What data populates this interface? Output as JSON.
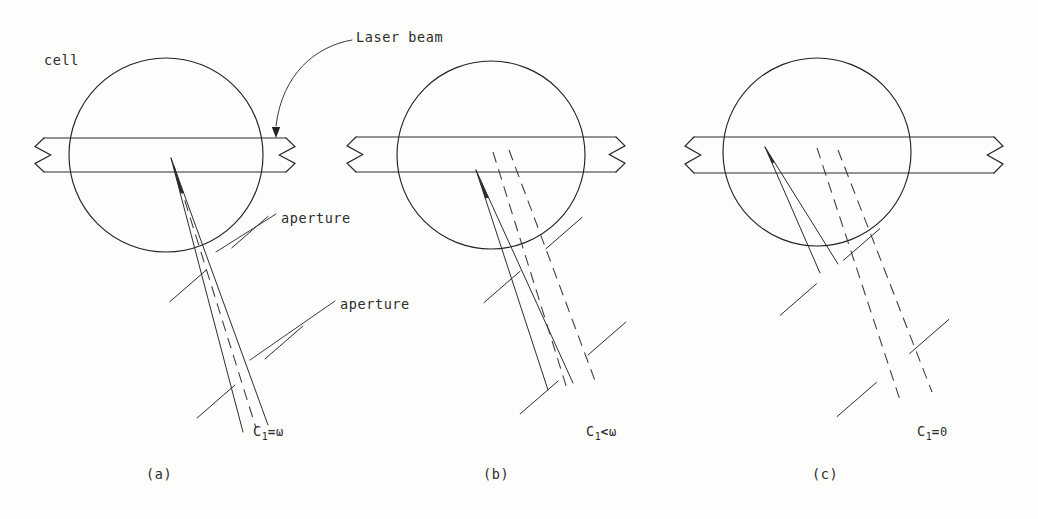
{
  "figure": {
    "title_text": "",
    "background": "#fdfdfc",
    "ink_color": "#232323",
    "width": 1038,
    "height": 519
  },
  "annotations": [
    {
      "name": "cell-label",
      "text": "cell",
      "x": 44,
      "y": 52
    },
    {
      "name": "laser-beam-label",
      "text": "Laser beam",
      "x": 356,
      "y": 29
    },
    {
      "name": "aperture-label-1",
      "text": "aperture",
      "x": 281,
      "y": 210
    },
    {
      "name": "aperture-label-2",
      "text": "aperture",
      "x": 340,
      "y": 296
    }
  ],
  "panels": [
    {
      "id": "a",
      "name": "panel-a",
      "caption": "(a)",
      "caption_x": 146,
      "caption_y": 466,
      "condition": {
        "symbol": "C",
        "subscript": "1",
        "relation": "=",
        "value": "ω",
        "x": 253,
        "y": 423
      },
      "cell_circle": {
        "cx": 166,
        "cy": 155,
        "r": 97
      },
      "tube": {
        "x_left": 30,
        "x_right": 300,
        "y_top": 138,
        "y_bottom": 172
      },
      "cone_apex": {
        "x": 171,
        "y": 158
      },
      "solid_rays": [
        {
          "x1": 171,
          "y1": 158,
          "x2": 243,
          "y2": 432
        },
        {
          "x1": 171,
          "y1": 158,
          "x2": 268,
          "y2": 425
        }
      ],
      "dashed_rays": [
        {
          "x1": 174,
          "y1": 166,
          "x2": 256,
          "y2": 428
        }
      ],
      "apertures": [
        {
          "name": "aperture-1",
          "cx": 219,
          "cy": 259,
          "angle_deg": -41,
          "gap": 17,
          "arm": 48
        },
        {
          "name": "aperture-2",
          "cx": 250,
          "cy": 372,
          "angle_deg": -41,
          "gap": 20,
          "arm": 50
        }
      ]
    },
    {
      "id": "b",
      "name": "panel-b",
      "caption": "(b)",
      "caption_x": 483,
      "caption_y": 466,
      "condition": {
        "symbol": "C",
        "subscript": "1",
        "relation": "<",
        "value": "ω",
        "x": 586,
        "y": 423
      },
      "cell_circle": {
        "cx": 491,
        "cy": 155,
        "r": 94
      },
      "tube": {
        "x_left": 342,
        "x_right": 630,
        "y_top": 137,
        "y_bottom": 172
      },
      "cone_apex": {
        "x": 476,
        "y": 170
      },
      "solid_rays": [
        {
          "x1": 476,
          "y1": 170,
          "x2": 548,
          "y2": 390
        },
        {
          "x1": 476,
          "y1": 170,
          "x2": 573,
          "y2": 383
        }
      ],
      "dashed_rays": [
        {
          "x1": 493,
          "y1": 152,
          "x2": 568,
          "y2": 392
        },
        {
          "x1": 509,
          "y1": 150,
          "x2": 597,
          "y2": 386
        }
      ],
      "apertures": [
        {
          "name": "aperture-1",
          "cx": 533,
          "cy": 260,
          "angle_deg": -41,
          "gap": 17,
          "arm": 48
        },
        {
          "name": "aperture-2",
          "cx": 573,
          "cy": 368,
          "angle_deg": -41,
          "gap": 20,
          "arm": 50
        }
      ]
    },
    {
      "id": "c",
      "name": "panel-c",
      "caption": "(c)",
      "caption_x": 812,
      "caption_y": 466,
      "condition": {
        "symbol": "C",
        "subscript": "1",
        "relation": "=",
        "value": "0",
        "x": 917,
        "y": 423
      },
      "cell_circle": {
        "cx": 817,
        "cy": 152,
        "r": 94
      },
      "tube": {
        "x_left": 680,
        "x_right": 1008,
        "y_top": 137,
        "y_bottom": 173
      },
      "cone_apex": {
        "x": 765,
        "y": 147
      },
      "solid_rays": [
        {
          "x1": 765,
          "y1": 147,
          "x2": 820,
          "y2": 273
        },
        {
          "x1": 765,
          "y1": 147,
          "x2": 838,
          "y2": 264
        }
      ],
      "dashed_rays": [
        {
          "x1": 817,
          "y1": 148,
          "x2": 900,
          "y2": 400
        },
        {
          "x1": 838,
          "y1": 150,
          "x2": 932,
          "y2": 392
        }
      ],
      "apertures": [
        {
          "name": "aperture-1",
          "cx": 830,
          "cy": 272,
          "angle_deg": -41,
          "gap": 18,
          "arm": 48
        },
        {
          "name": "aperture-2",
          "cx": 893,
          "cy": 368,
          "angle_deg": -41,
          "gap": 22,
          "arm": 52
        }
      ]
    }
  ],
  "laser_arrow": {
    "name": "laser-beam-leader",
    "path": "M 352 40 C 316 46 282 74 276 126",
    "tip": {
      "x": 276,
      "y": 138
    }
  },
  "aperture_leaders": [
    {
      "name": "aperture-leader-1",
      "x1": 276,
      "y1": 214,
      "x2": 216,
      "y2": 252
    },
    {
      "name": "aperture-leader-2",
      "x1": 335,
      "y1": 301,
      "x2": 250,
      "y2": 360
    }
  ],
  "legend": {
    "solid_meaning": "scattered light rays (solid)",
    "dashed_meaning": "beam axis / shifted rays (dashed)"
  }
}
